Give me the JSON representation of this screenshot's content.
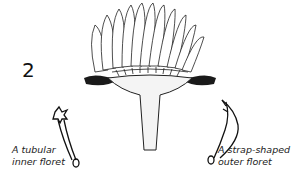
{
  "figure": {
    "number": "2",
    "labels": {
      "inner": [
        "A tubular",
        "inner floret"
      ],
      "outer": [
        "A strap-shaped",
        "outer floret"
      ]
    }
  }
}
